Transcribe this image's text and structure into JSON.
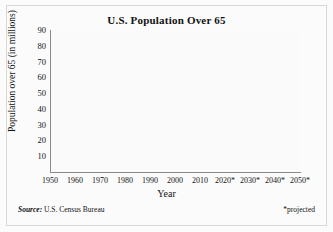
{
  "chart_data": {
    "type": "line",
    "title": "U.S. Population Over 65",
    "xlabel": "Year",
    "ylabel": "Population over 65 (in millions)",
    "xlim": [
      1950,
      2050
    ],
    "ylim": [
      0,
      90
    ],
    "grid": true,
    "legend": null,
    "x": [
      1950,
      1960,
      1970,
      1980,
      1990,
      2000,
      2010,
      2020,
      2030,
      2040,
      2050
    ],
    "xtick_labels": [
      "1950",
      "1960",
      "1970",
      "1980",
      "1990",
      "2000",
      "2010",
      "2020*",
      "2030*",
      "2040*",
      "2050*"
    ],
    "ytick_labels": [
      "10",
      "20",
      "30",
      "40",
      "50",
      "60",
      "70",
      "80",
      "90"
    ],
    "ytick_values": [
      10,
      20,
      30,
      40,
      50,
      60,
      70,
      80,
      90
    ],
    "values": [
      12,
      17,
      20,
      26,
      31,
      35,
      40,
      55,
      70,
      77,
      80
    ],
    "series": [
      {
        "name": "Population over 65",
        "values": [
          12,
          17,
          20,
          26,
          31,
          35,
          40,
          55,
          70,
          77,
          80
        ],
        "color": "#4a4a4a"
      }
    ],
    "annotations": {
      "source": "U.S. Census Bureau",
      "source_prefix": "Source:",
      "projected": "*projected"
    }
  },
  "colors": {
    "line": "#4a4a4a",
    "axis": "#8a8a8a",
    "grid": "#e6e6e6",
    "text": "#141414",
    "background": "#fbfbfb",
    "frame": "#d8d8d8"
  }
}
